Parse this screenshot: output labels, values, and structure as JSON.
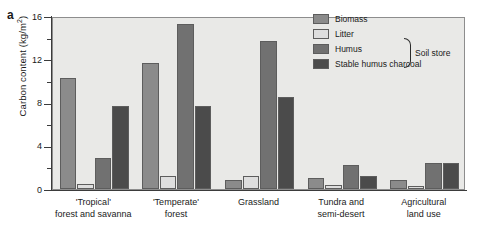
{
  "figure": {
    "panel_label": "a"
  },
  "legend": {
    "bracket_label": "Soil store",
    "items": [
      {
        "label": "Biomass",
        "color": "#8b8b8b"
      },
      {
        "label": "Litter",
        "color": "#dedede"
      },
      {
        "label": "Humus",
        "color": "#717171"
      },
      {
        "label": "Stable humus charcoal",
        "color": "#4b4b4b"
      }
    ]
  },
  "axes": {
    "y_title": "Carbon content (kg/m",
    "y_title_sup": "2",
    "y_title_end": ")",
    "y_ticks": [
      "0",
      "4",
      "8",
      "12",
      "16"
    ],
    "y_minor_ticks": [
      2,
      6,
      10,
      14
    ]
  },
  "categories": [
    {
      "line1": "'Tropical'",
      "line2": "forest and savanna"
    },
    {
      "line1": "'Temperate'",
      "line2": "forest"
    },
    {
      "line1": "Grassland",
      "line2": ""
    },
    {
      "line1": "Tundra and",
      "line2": "semi-desert"
    },
    {
      "line1": "Agricultural",
      "line2": "land use"
    }
  ],
  "chart_data": {
    "type": "bar",
    "title": "",
    "xlabel": "",
    "ylabel": "Carbon content (kg/m2)",
    "ylim": [
      0,
      16
    ],
    "y_major_step": 4,
    "y_minor_step": 2,
    "grid": false,
    "legend_position": "top-right",
    "categories": [
      "'Tropical' forest and savanna",
      "'Temperate' forest",
      "Grassland",
      "Tundra and semi-desert",
      "Agricultural land use"
    ],
    "series": [
      {
        "name": "Biomass",
        "color": "#8b8b8b",
        "values": [
          10.3,
          11.7,
          0.8,
          1.0,
          0.8
        ]
      },
      {
        "name": "Litter",
        "color": "#dedede",
        "values": [
          0.5,
          1.2,
          1.2,
          0.4,
          0.3
        ]
      },
      {
        "name": "Humus",
        "color": "#717171",
        "values": [
          2.9,
          15.3,
          13.7,
          2.2,
          2.4
        ]
      },
      {
        "name": "Stable humus charcoal",
        "color": "#4b4b4b",
        "values": [
          7.7,
          7.7,
          8.5,
          1.2,
          2.4
        ]
      }
    ]
  }
}
